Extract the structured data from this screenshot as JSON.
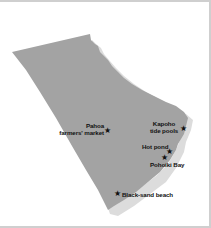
{
  "map": {
    "colors": {
      "land": "#a3a3a3",
      "reef": "#dcdcdc",
      "background": "#ffffff",
      "frame": "#cfcfcf",
      "label": "#111111"
    },
    "marker_icon": "★",
    "places": [
      {
        "id": "pahoa",
        "line1": "Pahoa",
        "line2": "farmers' market"
      },
      {
        "id": "kapoho",
        "line1": "Kapoho",
        "line2": "tide pools"
      },
      {
        "id": "hot-pond",
        "line1": "Hot pond"
      },
      {
        "id": "pohoiki",
        "line1": "Pohoiki Bay"
      },
      {
        "id": "black-sand",
        "line1": "Black-sand beach"
      }
    ]
  }
}
